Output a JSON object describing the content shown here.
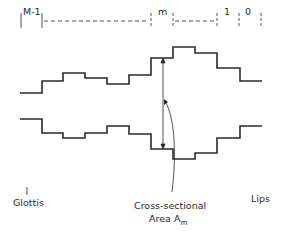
{
  "sections": {
    "labels": [
      "M-1",
      "m",
      "1",
      "0"
    ]
  },
  "profiles": {
    "upper_levels": [
      93,
      81,
      73,
      78,
      84,
      75,
      58,
      47,
      53,
      68,
      81
    ],
    "lower_levels": [
      119,
      133,
      138,
      133,
      126,
      134,
      149,
      159,
      153,
      138,
      126
    ]
  },
  "annotations": {
    "left_end": "Glottis",
    "right_end": "Lips",
    "area_line1": "Cross-sectional",
    "area_line2": "Area A",
    "area_subscript": "m"
  },
  "colors": {
    "line": "#2a2a2a",
    "background": "#ffffff"
  }
}
